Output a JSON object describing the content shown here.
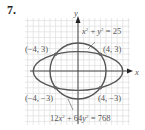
{
  "problem_number": "7.",
  "axes": {
    "x_label": "x",
    "y_label": "y"
  },
  "curves": [
    {
      "name": "circle",
      "equation": "x² + y² = 25",
      "radius": 5
    },
    {
      "name": "ellipse",
      "equation": "12x² + 64y² = 768",
      "a": 8,
      "b": 3.4641
    }
  ],
  "intersection_points": [
    {
      "label": "(−4, 3)",
      "x": -4,
      "y": 3
    },
    {
      "label": "(4, 3)",
      "x": 4,
      "y": 3
    },
    {
      "label": "(−4, −3)",
      "x": -4,
      "y": -3
    },
    {
      "label": "(4, −3)",
      "x": 4,
      "y": -3
    }
  ],
  "colors": {
    "curve": "#555555",
    "grid": "#d9d9d9",
    "axis": "#333333",
    "point": "#666666"
  }
}
